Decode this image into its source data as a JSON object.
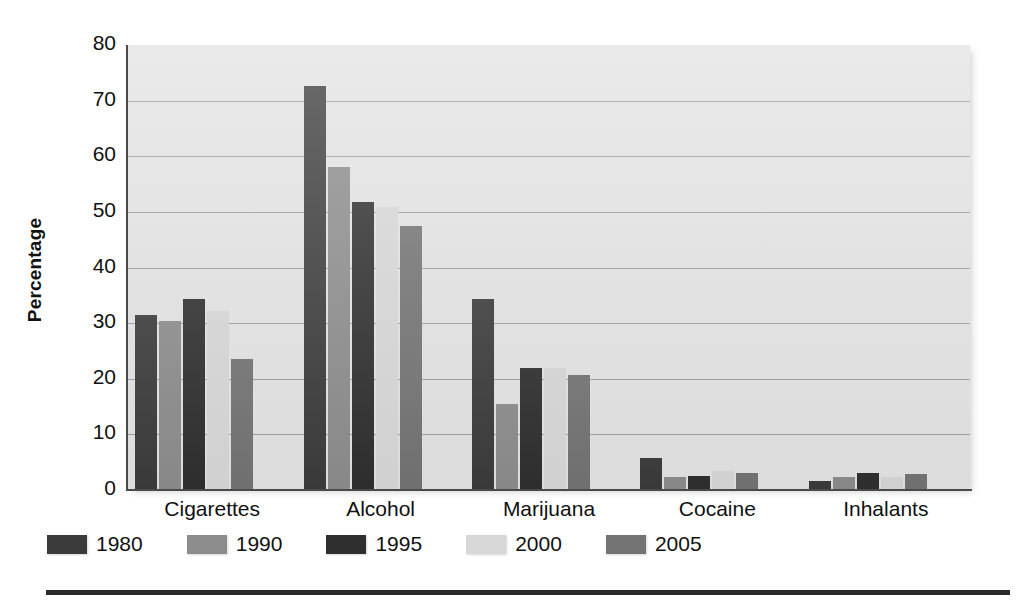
{
  "chart_data": {
    "type": "bar",
    "title": "",
    "subtitle": "",
    "xlabel": "",
    "ylabel": "Percentage",
    "ylim": [
      0,
      80
    ],
    "ytick_step": 10,
    "yticks": [
      "80",
      "70",
      "60",
      "50",
      "40",
      "30",
      "20",
      "10",
      "0"
    ],
    "grid": true,
    "legend_position": "below-plot-left",
    "categories": [
      "Cigarettes",
      "Alcohol",
      "Marijuana",
      "Cocaine",
      "Inhalants"
    ],
    "series": [
      {
        "name": "1980",
        "color": "#3b3b3b",
        "values": [
          31.5,
          72.7,
          34.4,
          5.7,
          1.6
        ]
      },
      {
        "name": "1990",
        "color": "#8c8c8c",
        "values": [
          30.3,
          58.0,
          15.4,
          2.4,
          2.3
        ]
      },
      {
        "name": "1995",
        "color": "#2f2f2f",
        "values": [
          34.3,
          51.8,
          22.0,
          2.6,
          3.1
        ]
      },
      {
        "name": "2000",
        "color": "#d7d7d7",
        "values": [
          32.2,
          50.8,
          22.0,
          3.5,
          2.3
        ]
      },
      {
        "name": "2005",
        "color": "#737373",
        "values": [
          23.5,
          47.4,
          20.6,
          3.0,
          2.8
        ]
      }
    ],
    "plot_background": "#e3e3e3",
    "gridline_color": "#9d9d9d",
    "axis_color": "#4a4a4a"
  },
  "legend": {
    "items": [
      {
        "label": "1980"
      },
      {
        "label": "1990"
      },
      {
        "label": "1995"
      },
      {
        "label": "2000"
      },
      {
        "label": "2005"
      }
    ]
  }
}
